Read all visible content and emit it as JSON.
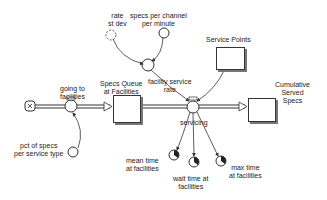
{
  "diagram": {
    "type": "stock-and-flow",
    "stocks": [
      {
        "id": "specs-queue",
        "label": "Specs Queue\nat Facilities"
      },
      {
        "id": "cumulative-served",
        "label": "Cumulative\nServed\nSpecs"
      },
      {
        "id": "service-points",
        "label": "Service Points"
      }
    ],
    "flows": [
      {
        "id": "going-to-facilities",
        "label": "going to\nfacilities"
      },
      {
        "id": "servicing",
        "label": "servicing"
      }
    ],
    "auxiliaries": [
      {
        "id": "rate-st-dev",
        "label": "rate\nst dev"
      },
      {
        "id": "specs-per-channel",
        "label": "specs per channel\nper minute"
      },
      {
        "id": "facility-service-rate",
        "label": "facility service\nrate"
      },
      {
        "id": "pct-of-specs",
        "label": "pct of specs\nper service type"
      },
      {
        "id": "mean-time",
        "label": "mean time\nat facilities"
      },
      {
        "id": "wait-time",
        "label": "wait time at\nfacilities"
      },
      {
        "id": "max-time",
        "label": "max time\nat facilities"
      }
    ],
    "colors": {
      "line": "#333333",
      "shadow": "#777777",
      "background": "#ffffff"
    }
  }
}
